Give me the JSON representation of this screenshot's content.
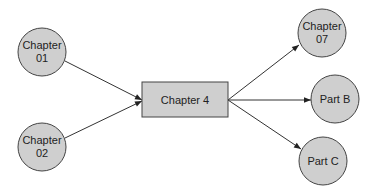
{
  "diagram": {
    "type": "flow",
    "fill_color": "#cfcfcf",
    "stroke_color": "#333333",
    "center_node": {
      "id": "ch4",
      "label": "Chapter 4",
      "shape": "rect"
    },
    "nodes": [
      {
        "id": "ch01",
        "lines": [
          "Chapter",
          "01"
        ],
        "shape": "circle"
      },
      {
        "id": "ch02",
        "lines": [
          "Chapter",
          "02"
        ],
        "shape": "circle"
      },
      {
        "id": "ch07",
        "lines": [
          "Chapter",
          "07"
        ],
        "shape": "circle"
      },
      {
        "id": "partB",
        "lines": [
          "Part B"
        ],
        "shape": "circle"
      },
      {
        "id": "partC",
        "lines": [
          "Part C"
        ],
        "shape": "circle"
      }
    ],
    "edges": [
      {
        "from": "ch01",
        "to": "ch4"
      },
      {
        "from": "ch02",
        "to": "ch4"
      },
      {
        "from": "ch4",
        "to": "ch07"
      },
      {
        "from": "ch4",
        "to": "partB"
      },
      {
        "from": "ch4",
        "to": "partC"
      }
    ]
  }
}
